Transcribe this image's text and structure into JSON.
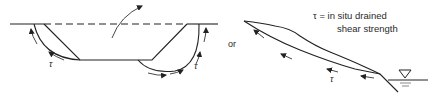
{
  "diagram": {
    "type": "geotechnical slope stability schematic",
    "left_figure": {
      "description": "Excavation cut with circular slip surfaces at both side slopes",
      "tau_labels": [
        "τ",
        "τ"
      ]
    },
    "connector_text": "or",
    "right_figure": {
      "description": "Natural slope with translational slip surface down to water table",
      "tau_label": "τ",
      "water_table_symbol": "▽"
    },
    "legend": {
      "line1": "τ = in situ drained",
      "line2": "shear strength"
    },
    "colors": {
      "line": "#222222",
      "background": "#ffffff"
    }
  }
}
